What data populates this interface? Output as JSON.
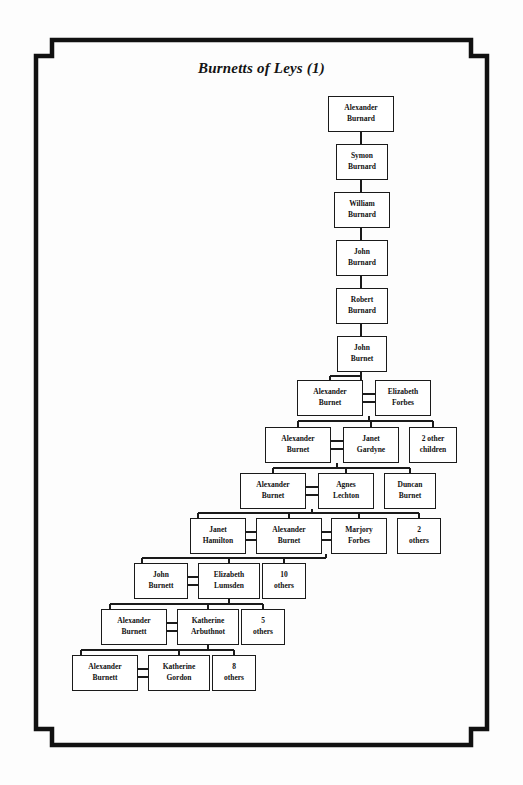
{
  "page": {
    "title": "Burnetts of Leys (1)",
    "frame_color": "#111111",
    "background_color": "#fdfdfd",
    "box_border_color": "#1a1a1a",
    "text_color": "#111111"
  },
  "chart_data": {
    "type": "diagram",
    "title": "Burnetts of Leys (1)",
    "subtype": "family-tree",
    "generations": 13,
    "nodes": [
      {
        "id": "n1",
        "line1": "Alexander",
        "line2": "Burnard",
        "x": 328,
        "y": 96,
        "w": 66,
        "h": 36,
        "kind": "person",
        "generation": 1
      },
      {
        "id": "n2",
        "line1": "Symon",
        "line2": "Burnard",
        "x": 336,
        "y": 144,
        "w": 52,
        "h": 36,
        "kind": "person",
        "generation": 2
      },
      {
        "id": "n3",
        "line1": "William",
        "line2": "Burnard",
        "x": 334,
        "y": 192,
        "w": 56,
        "h": 36,
        "kind": "person",
        "generation": 3
      },
      {
        "id": "n4",
        "line1": "John",
        "line2": "Burnard",
        "x": 336,
        "y": 240,
        "w": 52,
        "h": 36,
        "kind": "person",
        "generation": 4
      },
      {
        "id": "n5",
        "line1": "Robert",
        "line2": "Burnard",
        "x": 336,
        "y": 288,
        "w": 52,
        "h": 36,
        "kind": "person",
        "generation": 5
      },
      {
        "id": "n6",
        "line1": "John",
        "line2": "Burnet",
        "x": 337,
        "y": 336,
        "w": 50,
        "h": 36,
        "kind": "person",
        "generation": 6
      },
      {
        "id": "n7",
        "line1": "Alexander",
        "line2": "Burnet",
        "x": 297,
        "y": 380,
        "w": 66,
        "h": 36,
        "kind": "person",
        "generation": 7
      },
      {
        "id": "n8",
        "line1": "Elizabeth",
        "line2": "Forbes",
        "x": 375,
        "y": 380,
        "w": 56,
        "h": 36,
        "kind": "spouse",
        "generation": 7
      },
      {
        "id": "n9",
        "line1": "Alexander",
        "line2": "Burnet",
        "x": 265,
        "y": 427,
        "w": 66,
        "h": 36,
        "kind": "person",
        "generation": 8
      },
      {
        "id": "n10",
        "line1": "Janet",
        "line2": "Gardyne",
        "x": 343,
        "y": 427,
        "w": 56,
        "h": 36,
        "kind": "spouse",
        "generation": 8
      },
      {
        "id": "n11",
        "line1": "2 other",
        "line2": "children",
        "x": 409,
        "y": 427,
        "w": 48,
        "h": 36,
        "kind": "others",
        "generation": 8
      },
      {
        "id": "n12",
        "line1": "Alexander",
        "line2": "Burnet",
        "x": 240,
        "y": 473,
        "w": 66,
        "h": 36,
        "kind": "person",
        "generation": 9
      },
      {
        "id": "n13",
        "line1": "Agnes",
        "line2": "Lechton",
        "x": 318,
        "y": 473,
        "w": 56,
        "h": 36,
        "kind": "spouse",
        "generation": 9
      },
      {
        "id": "n14",
        "line1": "Duncan",
        "line2": "Burnet",
        "x": 384,
        "y": 473,
        "w": 52,
        "h": 36,
        "kind": "sibling",
        "generation": 9
      },
      {
        "id": "n15",
        "line1": "Janet",
        "line2": "Hamilton",
        "x": 190,
        "y": 518,
        "w": 56,
        "h": 36,
        "kind": "spouse",
        "generation": 10
      },
      {
        "id": "n16",
        "line1": "Alexander",
        "line2": "Burnet",
        "x": 256,
        "y": 518,
        "w": 66,
        "h": 36,
        "kind": "person",
        "generation": 10
      },
      {
        "id": "n17",
        "line1": "Marjory",
        "line2": "Forbes",
        "x": 331,
        "y": 518,
        "w": 56,
        "h": 36,
        "kind": "spouse",
        "generation": 10
      },
      {
        "id": "n18",
        "line1": "2",
        "line2": "others",
        "x": 397,
        "y": 518,
        "w": 44,
        "h": 36,
        "kind": "others",
        "generation": 10
      },
      {
        "id": "n19",
        "line1": "John",
        "line2": "Burnett",
        "x": 134,
        "y": 563,
        "w": 54,
        "h": 36,
        "kind": "person",
        "generation": 11
      },
      {
        "id": "n20",
        "line1": "Elizabeth",
        "line2": "Lumsden",
        "x": 198,
        "y": 563,
        "w": 62,
        "h": 36,
        "kind": "spouse",
        "generation": 11
      },
      {
        "id": "n21",
        "line1": "10",
        "line2": "others",
        "x": 262,
        "y": 563,
        "w": 44,
        "h": 36,
        "kind": "others",
        "generation": 11
      },
      {
        "id": "n22",
        "line1": "Alexander",
        "line2": "Burnett",
        "x": 101,
        "y": 609,
        "w": 66,
        "h": 36,
        "kind": "person",
        "generation": 12
      },
      {
        "id": "n23",
        "line1": "Katherine",
        "line2": "Arbuthnot",
        "x": 177,
        "y": 609,
        "w": 62,
        "h": 36,
        "kind": "spouse",
        "generation": 12
      },
      {
        "id": "n24",
        "line1": "5",
        "line2": "others",
        "x": 241,
        "y": 609,
        "w": 44,
        "h": 36,
        "kind": "others",
        "generation": 12
      },
      {
        "id": "n25",
        "line1": "Alexander",
        "line2": "Burnett",
        "x": 72,
        "y": 655,
        "w": 66,
        "h": 36,
        "kind": "person",
        "generation": 13
      },
      {
        "id": "n26",
        "line1": "Katherine",
        "line2": "Gordon",
        "x": 148,
        "y": 655,
        "w": 62,
        "h": 36,
        "kind": "spouse",
        "generation": 13
      },
      {
        "id": "n27",
        "line1": "8",
        "line2": "others",
        "x": 212,
        "y": 655,
        "w": 44,
        "h": 36,
        "kind": "others",
        "generation": 13
      }
    ],
    "relations": [
      {
        "type": "descent",
        "from": "n1",
        "to": "n2"
      },
      {
        "type": "descent",
        "from": "n2",
        "to": "n3"
      },
      {
        "type": "descent",
        "from": "n3",
        "to": "n4"
      },
      {
        "type": "descent",
        "from": "n4",
        "to": "n5"
      },
      {
        "type": "descent",
        "from": "n5",
        "to": "n6"
      },
      {
        "type": "descent",
        "from": "n6",
        "to": "n7"
      },
      {
        "type": "marriage",
        "from": "n7",
        "to": "n8"
      },
      {
        "type": "marriage",
        "from": "n9",
        "to": "n10"
      },
      {
        "type": "marriage",
        "from": "n12",
        "to": "n13"
      },
      {
        "type": "marriage",
        "from": "n15",
        "to": "n16"
      },
      {
        "type": "marriage",
        "from": "n16",
        "to": "n17"
      },
      {
        "type": "marriage",
        "from": "n19",
        "to": "n20"
      },
      {
        "type": "marriage",
        "from": "n22",
        "to": "n23"
      },
      {
        "type": "marriage",
        "from": "n25",
        "to": "n26"
      },
      {
        "type": "children",
        "parents": [
          "n7",
          "n8"
        ],
        "children": [
          "n9",
          "n10",
          "n11"
        ]
      },
      {
        "type": "children",
        "parents": [
          "n9",
          "n10"
        ],
        "children": [
          "n12",
          "n13",
          "n14"
        ]
      },
      {
        "type": "children",
        "parents": [
          "n12",
          "n13"
        ],
        "children": [
          "n15",
          "n16",
          "n17",
          "n18"
        ]
      },
      {
        "type": "children",
        "parents": [
          "n16",
          "n17"
        ],
        "children": [
          "n19",
          "n20",
          "n21"
        ]
      },
      {
        "type": "children",
        "parents": [
          "n19",
          "n20"
        ],
        "children": [
          "n22",
          "n23",
          "n24"
        ]
      },
      {
        "type": "children",
        "parents": [
          "n22",
          "n23"
        ],
        "children": [
          "n25",
          "n26",
          "n27"
        ]
      }
    ]
  }
}
